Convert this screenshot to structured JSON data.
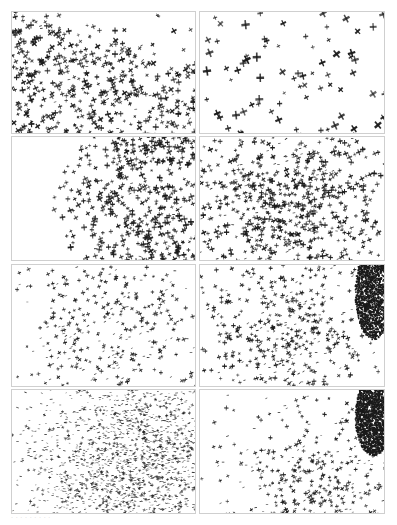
{
  "figure": {
    "caption": "· · · · · ·  · · ·",
    "ink_color": "#1a1a1a",
    "border_color": "#cfcfcf",
    "panels": [
      {
        "id": "a",
        "x": 11,
        "y": 11,
        "w": 185,
        "h": 123,
        "count": 520,
        "size": 2.2,
        "angle": -0.35,
        "cx": 0.35,
        "cy": 0.55,
        "sx": 0.7,
        "sy": 0.6,
        "falloff": "upper-right-sparse",
        "blob": null
      },
      {
        "id": "b",
        "x": 199,
        "y": 11,
        "w": 186,
        "h": 123,
        "count": 75,
        "size": 3.0,
        "angle": -0.4,
        "cx": 0.5,
        "cy": 0.5,
        "sx": 0.9,
        "sy": 0.9,
        "falloff": "uniform",
        "blob": null
      },
      {
        "id": "c",
        "x": 11,
        "y": 136,
        "w": 185,
        "h": 125,
        "count": 560,
        "size": 2.2,
        "angle": -0.2,
        "cx": 0.75,
        "cy": 0.55,
        "sx": 0.45,
        "sy": 0.7,
        "falloff": "left-edge",
        "blob": null
      },
      {
        "id": "d",
        "x": 199,
        "y": 136,
        "w": 186,
        "h": 125,
        "count": 900,
        "size": 2.0,
        "angle": -0.25,
        "cx": 0.45,
        "cy": 0.6,
        "sx": 0.35,
        "sy": 0.4,
        "falloff": "gaussian",
        "blob": null
      },
      {
        "id": "e",
        "x": 11,
        "y": 264,
        "w": 185,
        "h": 123,
        "count": 480,
        "size": 1.6,
        "angle": -0.3,
        "cx": 0.55,
        "cy": 0.5,
        "sx": 0.33,
        "sy": 0.45,
        "falloff": "gaussian",
        "blob": null
      },
      {
        "id": "f",
        "x": 199,
        "y": 264,
        "w": 186,
        "h": 123,
        "count": 560,
        "size": 1.7,
        "angle": -0.3,
        "cx": 0.48,
        "cy": 0.55,
        "sx": 0.25,
        "sy": 0.4,
        "falloff": "gaussian",
        "blob": {
          "cx": 0.93,
          "cy": 0.22,
          "rx": 0.1,
          "ry": 0.38
        }
      },
      {
        "id": "g",
        "x": 11,
        "y": 389,
        "w": 185,
        "h": 125,
        "count": 2600,
        "size": 1.1,
        "angle": 0,
        "cx": 0.68,
        "cy": 0.62,
        "sx": 0.3,
        "sy": 0.45,
        "falloff": "gaussian",
        "blob": null
      },
      {
        "id": "h",
        "x": 199,
        "y": 389,
        "w": 186,
        "h": 125,
        "count": 520,
        "size": 1.6,
        "angle": -0.3,
        "cx": 0.65,
        "cy": 0.7,
        "sx": 0.3,
        "sy": 0.35,
        "falloff": "gaussian",
        "blob": {
          "cx": 0.93,
          "cy": 0.2,
          "rx": 0.1,
          "ry": 0.32
        }
      }
    ]
  }
}
